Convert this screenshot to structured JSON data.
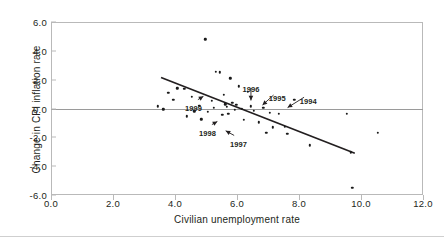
{
  "chart_data": {
    "type": "scatter",
    "title": "",
    "xlabel": "Civilian unemployment rate",
    "ylabel": "Change in CPI inflation rate",
    "xlim": [
      0.0,
      12.0
    ],
    "ylim": [
      -6.0,
      6.0
    ],
    "xticks": [
      "0.0",
      "2.0",
      "4.0",
      "6.0",
      "8.0",
      "10.0",
      "12.0"
    ],
    "yticks": [
      "6.0",
      "4.0",
      "2.0",
      "0.0",
      "-2.0",
      "-4.0",
      "-6.0"
    ],
    "grid": false,
    "legend": "none",
    "zero_line": 0.0,
    "points": [
      {
        "x": 3.45,
        "y": 0.15
      },
      {
        "x": 3.62,
        "y": -0.05
      },
      {
        "x": 3.78,
        "y": 1.1
      },
      {
        "x": 3.95,
        "y": 0.6
      },
      {
        "x": 4.08,
        "y": 1.4
      },
      {
        "x": 4.3,
        "y": 1.35
      },
      {
        "x": 4.38,
        "y": -0.55
      },
      {
        "x": 4.55,
        "y": 0.8
      },
      {
        "x": 4.62,
        "y": -0.2
      },
      {
        "x": 4.78,
        "y": 0.2
      },
      {
        "x": 4.85,
        "y": -0.75
      },
      {
        "x": 4.98,
        "y": 4.8
      },
      {
        "x": 5.05,
        "y": -0.25
      },
      {
        "x": 5.18,
        "y": 0.55
      },
      {
        "x": 5.25,
        "y": 0.05
      },
      {
        "x": 5.32,
        "y": 2.55
      },
      {
        "x": 5.45,
        "y": 2.5
      },
      {
        "x": 5.52,
        "y": -0.45
      },
      {
        "x": 5.58,
        "y": 0.95
      },
      {
        "x": 5.62,
        "y": 0.3
      },
      {
        "x": 5.68,
        "y": 0.1
      },
      {
        "x": 5.72,
        "y": -0.35
      },
      {
        "x": 5.78,
        "y": 2.1
      },
      {
        "x": 5.85,
        "y": 0.4
      },
      {
        "x": 5.92,
        "y": -0.1
      },
      {
        "x": 5.98,
        "y": 0.25
      },
      {
        "x": 6.05,
        "y": 1.55
      },
      {
        "x": 6.15,
        "y": 0.0
      },
      {
        "x": 6.22,
        "y": -0.8
      },
      {
        "x": 6.35,
        "y": 1.15
      },
      {
        "x": 6.45,
        "y": 0.15
      },
      {
        "x": 6.55,
        "y": -0.15
      },
      {
        "x": 6.7,
        "y": -0.95
      },
      {
        "x": 6.85,
        "y": 0.05
      },
      {
        "x": 6.95,
        "y": -1.7
      },
      {
        "x": 7.05,
        "y": -0.3
      },
      {
        "x": 7.15,
        "y": -1.3
      },
      {
        "x": 7.35,
        "y": -0.35
      },
      {
        "x": 7.55,
        "y": -1.25
      },
      {
        "x": 7.62,
        "y": -1.75
      },
      {
        "x": 7.85,
        "y": 0.6
      },
      {
        "x": 8.35,
        "y": -2.55
      },
      {
        "x": 9.55,
        "y": -0.35
      },
      {
        "x": 9.68,
        "y": -3.05
      },
      {
        "x": 9.72,
        "y": -5.5
      },
      {
        "x": 10.55,
        "y": -1.7
      }
    ],
    "trendline": {
      "x1": 3.55,
      "y1": 2.15,
      "x2": 9.8,
      "y2": -3.1
    },
    "annotations": [
      {
        "label": "1999",
        "lx": 4.6,
        "ly": 0.02,
        "px": 5.0,
        "py": 0.95
      },
      {
        "label": "1998",
        "lx": 5.05,
        "ly": -1.7,
        "px": 5.45,
        "py": -0.8
      },
      {
        "label": "1997",
        "lx": 6.05,
        "ly": -2.45,
        "px": 5.55,
        "py": -1.45
      },
      {
        "label": "1996",
        "lx": 6.45,
        "ly": 1.35,
        "px": 6.45,
        "py": 0.35
      },
      {
        "label": "1995",
        "lx": 7.3,
        "ly": 0.75,
        "px": 6.75,
        "py": 0.1
      },
      {
        "label": "1994",
        "lx": 8.3,
        "ly": 0.55,
        "px": 7.55,
        "py": -0.05
      }
    ]
  },
  "colors": {
    "point": "#1a1a1a",
    "trendline": "#231f20",
    "frame": "#b9b9b9",
    "zero_line": "#9a9a9a",
    "text": "#231f20"
  }
}
